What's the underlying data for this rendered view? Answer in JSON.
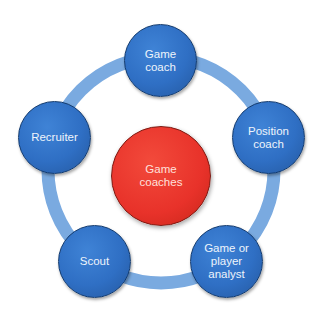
{
  "diagram": {
    "type": "hub-and-ring",
    "colors": {
      "ring": "#7aaae0",
      "node": "#2f6fc4",
      "center": "#e8322a"
    },
    "center": {
      "label": "Game\ncoaches"
    },
    "nodes": [
      {
        "label": "Game\ncoach"
      },
      {
        "label": "Position\ncoach"
      },
      {
        "label": "Game or\nplayer\nanalyst"
      },
      {
        "label": "Scout"
      },
      {
        "label": "Recruiter"
      }
    ]
  }
}
